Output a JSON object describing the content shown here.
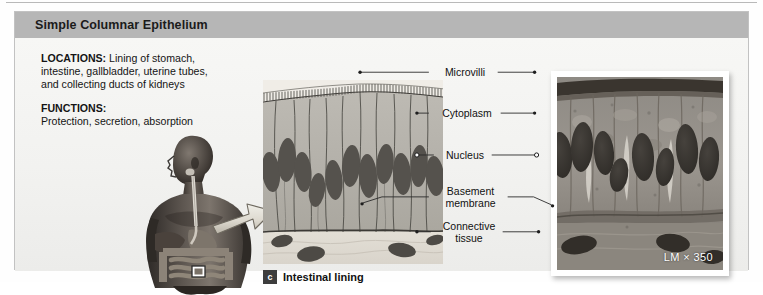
{
  "header": {
    "title": "Simple Columnar Epithelium"
  },
  "info": {
    "locations_lead": "LOCATIONS:",
    "locations_text": " Lining of stomach, intestine, gallbladder, uterine tubes, and collecting ducts of kidneys",
    "functions_lead": "FUNCTIONS:",
    "functions_text": "Protection, secretion, absorption"
  },
  "caption": {
    "badge": "c",
    "text": "Intestinal lining"
  },
  "labels": [
    {
      "name": "microvilli",
      "text": "Microvilli"
    },
    {
      "name": "cytoplasm",
      "text": "Cytoplasm"
    },
    {
      "name": "nucleus",
      "text": "Nucleus"
    },
    {
      "name": "basement-membrane",
      "text": "Basement\nmembrane"
    },
    {
      "name": "connective-tissue",
      "text": "Connective\ntissue"
    }
  ],
  "micrograph": {
    "magnification": "LM × 350"
  },
  "colors": {
    "header_band": "#b6b6b6",
    "panel_bg": "#f4f4f2",
    "panel_border": "#c2c2c2",
    "cell_fill": "#b5b2ab",
    "nucleus_fill": "#4f4d49",
    "connective_fill": "#ddd9d1",
    "badge_bg": "#3d3d3d",
    "text": "#141414"
  }
}
